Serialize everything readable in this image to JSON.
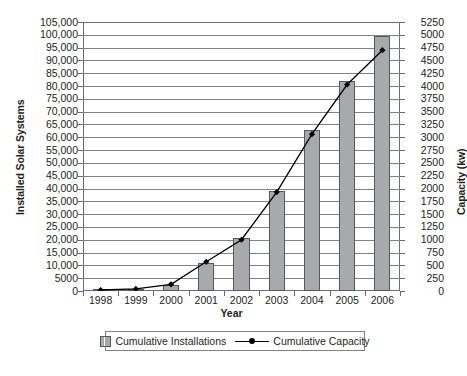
{
  "chart_data": {
    "type": "bar",
    "title": "",
    "xlabel": "Year",
    "ylabel": "Installed Solar Systems",
    "y2label": "Capacity (kw)",
    "categories": [
      "1998",
      "1999",
      "2000",
      "2001",
      "2002",
      "2003",
      "2004",
      "2005",
      "2006"
    ],
    "ylim": [
      0,
      105000
    ],
    "y2lim": [
      0,
      5250
    ],
    "grid": true,
    "legend_position": "bottom",
    "yticks": [
      "0",
      "5000",
      "10,000",
      "15,000",
      "20,000",
      "25,000",
      "30,000",
      "35,000",
      "40,000",
      "45,000",
      "50,000",
      "55,000",
      "60,000",
      "65,000",
      "70,000",
      "75,000",
      "80,000",
      "85,000",
      "90,000",
      "95,000",
      "100,000",
      "105,000"
    ],
    "ytick_values": [
      0,
      5000,
      10000,
      15000,
      20000,
      25000,
      30000,
      35000,
      40000,
      45000,
      50000,
      55000,
      60000,
      65000,
      70000,
      75000,
      80000,
      85000,
      90000,
      95000,
      100000,
      105000
    ],
    "y2ticks": [
      "0",
      "250",
      "500",
      "750",
      "1000",
      "1250",
      "1500",
      "1750",
      "2000",
      "2250",
      "2500",
      "2750",
      "3000",
      "3250",
      "3500",
      "3750",
      "4000",
      "4250",
      "4500",
      "4750",
      "5000",
      "5250"
    ],
    "y2tick_values": [
      0,
      250,
      500,
      750,
      1000,
      1250,
      1500,
      1750,
      2000,
      2250,
      2500,
      2750,
      3000,
      3250,
      3500,
      3750,
      4000,
      4250,
      4500,
      4750,
      5000,
      5250
    ],
    "series": [
      {
        "name": "Cumulative Installations",
        "type": "bar",
        "axis": "left",
        "color": "#a7a9ac",
        "edge_color": "#58595b",
        "values": [
          300,
          700,
          2500,
          11000,
          20500,
          39000,
          63000,
          82000,
          99500
        ]
      },
      {
        "name": "Cumulative Capacity",
        "type": "line",
        "axis": "right",
        "color": "#000000",
        "marker": "diamond",
        "values": [
          20,
          40,
          130,
          570,
          1000,
          1930,
          3060,
          4030,
          4700
        ]
      }
    ]
  },
  "legend": {
    "items": [
      {
        "label": "Cumulative Installations",
        "swatch": "bar-swatch"
      },
      {
        "label": "Cumulative Capacity",
        "swatch": "line-swatch"
      }
    ]
  }
}
